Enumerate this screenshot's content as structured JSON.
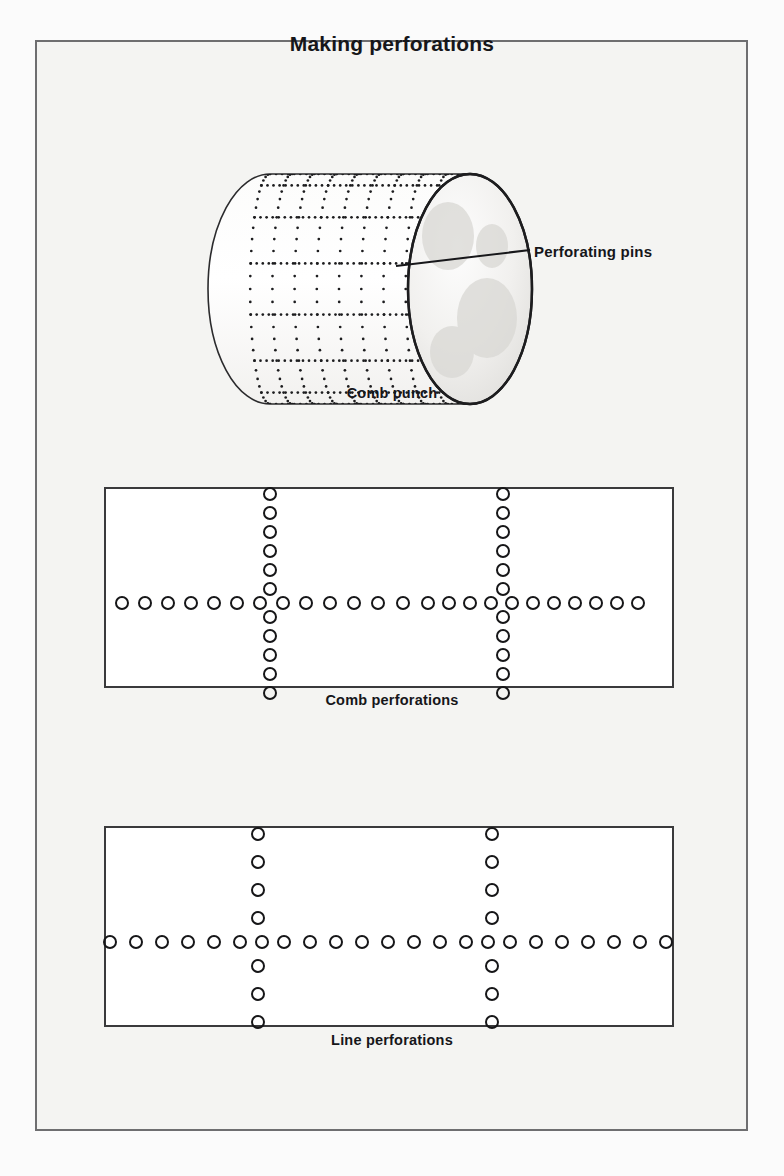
{
  "figure": {
    "title": "Making perforations",
    "background_color": "#f4f4f2",
    "frame_color": "#6e6e70",
    "ink_color": "#161618"
  },
  "panels": [
    {
      "id": "comb-punch",
      "caption": "Comb punch",
      "annotation": {
        "label": "Perforating pins",
        "leader_from": [
          468,
          259
        ],
        "leader_to": [
          530,
          252
        ]
      },
      "drawing": "cylinder-with-dotted-pin-grid"
    },
    {
      "id": "comb-perforations",
      "caption": "Comb perforations",
      "frame": {
        "x": 104,
        "y": 487,
        "width": 570,
        "height": 201
      },
      "hole_diameter": 14,
      "horizontal_row": {
        "y": 603,
        "description": "single horizontal row of holes broken into comb segments",
        "x_positions": [
          122,
          145,
          168,
          191,
          214,
          237,
          260,
          283,
          306,
          330,
          354,
          378,
          403,
          428,
          449,
          470,
          491,
          512,
          533,
          554,
          575,
          596,
          617,
          638
        ]
      },
      "vertical_columns": [
        {
          "x": 270,
          "description": "tightly packed column of holes, top to bottom",
          "y_positions": [
            494,
            513,
            532,
            551,
            570,
            589,
            603,
            617,
            636,
            655,
            674,
            693
          ]
        },
        {
          "x": 503,
          "description": "tightly packed column of holes, top to bottom",
          "y_positions": [
            494,
            513,
            532,
            551,
            570,
            589,
            603,
            617,
            636,
            655,
            674,
            693
          ]
        }
      ]
    },
    {
      "id": "line-perforations",
      "caption": "Line perforations",
      "frame": {
        "x": 104,
        "y": 826,
        "width": 570,
        "height": 201
      },
      "hole_diameter": 14,
      "horizontal_row": {
        "y": 942,
        "description": "continuous evenly spaced horizontal row of holes running past both frame edges",
        "x_positions": [
          110,
          136,
          162,
          188,
          214,
          240,
          262,
          284,
          310,
          336,
          362,
          388,
          414,
          440,
          466,
          488,
          510,
          536,
          562,
          588,
          614,
          640,
          666
        ]
      },
      "vertical_columns": [
        {
          "x": 258,
          "description": "evenly spaced column of holes with visible gaps",
          "y_positions": [
            834,
            862,
            890,
            918,
            942,
            966,
            994,
            1022
          ]
        },
        {
          "x": 492,
          "description": "evenly spaced column of holes with visible gaps",
          "y_positions": [
            834,
            862,
            890,
            918,
            942,
            966,
            994,
            1022
          ]
        }
      ]
    }
  ]
}
